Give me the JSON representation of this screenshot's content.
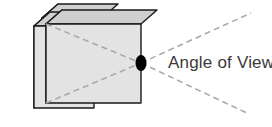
{
  "diagram": {
    "title": "Angle of View",
    "background_color": "#ffffff",
    "label": {
      "text": "Angle of View",
      "color": "#3a3a3a",
      "x": 168,
      "y": 68
    },
    "vertex_point": {
      "name": "angle-of-view-vertex",
      "color": "#000000",
      "cx": 141,
      "cy": 63,
      "rx": 5.5,
      "ry": 8
    },
    "colors": {
      "front_face": "#e3e3e3",
      "top_face": "#cfcfcf",
      "side_face": "#b4b4b4",
      "outline": "#1a1a1a",
      "dashed_line": "#a9a9a9",
      "label_text": "#3a3a3a",
      "vertex_dot": "#000000"
    },
    "boxes": [
      {
        "name": "box-back",
        "front": "42,18 102,18 102,100 42,100",
        "top": "42,18 58,4 118,4 102,18",
        "side": "42,18 58,4 58,86 42,100"
      },
      {
        "name": "box-middle",
        "front": "34,26 94,26 94,108 34,108",
        "top": "34,26 50,12 110,12 94,26",
        "side": "34,26 50,12 50,94 34,108"
      },
      {
        "name": "box-front",
        "front": "46,24 141,24 141,103 46,103",
        "top": "46,24 62,10 157,10 141,24",
        "side": "46,24 62,10 62,89 46,103"
      }
    ],
    "dashed_lines": [
      {
        "name": "cone-line-upper-left",
        "x1": 46,
        "y1": 24,
        "x2": 141,
        "y2": 63
      },
      {
        "name": "cone-line-lower-left",
        "x1": 46,
        "y1": 103,
        "x2": 141,
        "y2": 63
      },
      {
        "name": "cone-line-upper-right",
        "x1": 141,
        "y1": 63,
        "x2": 251,
        "y2": 13
      },
      {
        "name": "cone-line-lower-right",
        "x1": 141,
        "y1": 63,
        "x2": 249,
        "y2": 114
      }
    ],
    "dash_pattern": "6 4",
    "dash_width": 1.6,
    "outline_width": 1.4
  }
}
